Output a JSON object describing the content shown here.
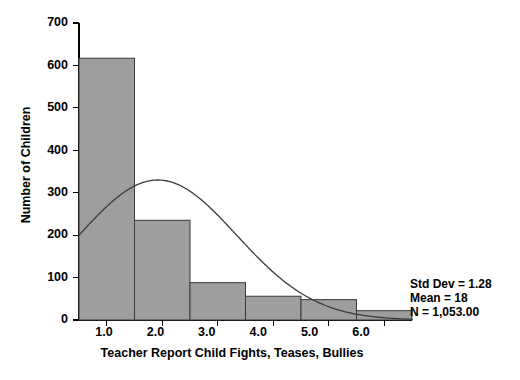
{
  "chart_data": {
    "type": "bar",
    "title": "",
    "subtitle": "",
    "xlabel": "Teacher Report Child Fights, Teases, Bullies",
    "ylabel": "Number of Children",
    "categories": [
      "1.0",
      "2.0",
      "3.0",
      "4.0",
      "5.0",
      "6.0"
    ],
    "x": [
      1.0,
      2.0,
      3.0,
      4.0,
      5.0,
      6.0
    ],
    "values": [
      617,
      235,
      88,
      56,
      48,
      22
    ],
    "bin_width": 1.0,
    "xlim": [
      0.5,
      6.5
    ],
    "ylim": [
      0,
      700
    ],
    "xticks": [
      "1.0",
      "2.0",
      "3.0",
      "4.0",
      "5.0",
      "6.0"
    ],
    "yticks": [
      "0",
      "100",
      "200",
      "300",
      "400",
      "500",
      "600",
      "700"
    ],
    "ytick_values": [
      0,
      100,
      200,
      300,
      400,
      500,
      600,
      700
    ],
    "grid": false,
    "legend": "none",
    "bar_color": "#9e9e9e",
    "bar_edge_color": "#3a3a3a",
    "curve_color": "#3c3c3c",
    "overlay": {
      "type": "normal-curve",
      "peak_value": 330,
      "peak_x": 1.92,
      "left_edge_value": 200
    },
    "annotations": {
      "std_dev_label": "Std Dev = 1.28",
      "mean_label": "Mean = 18",
      "n_label": "N = 1,053.00",
      "std_dev": 1.28,
      "mean": 18,
      "n": 1053.0
    }
  }
}
